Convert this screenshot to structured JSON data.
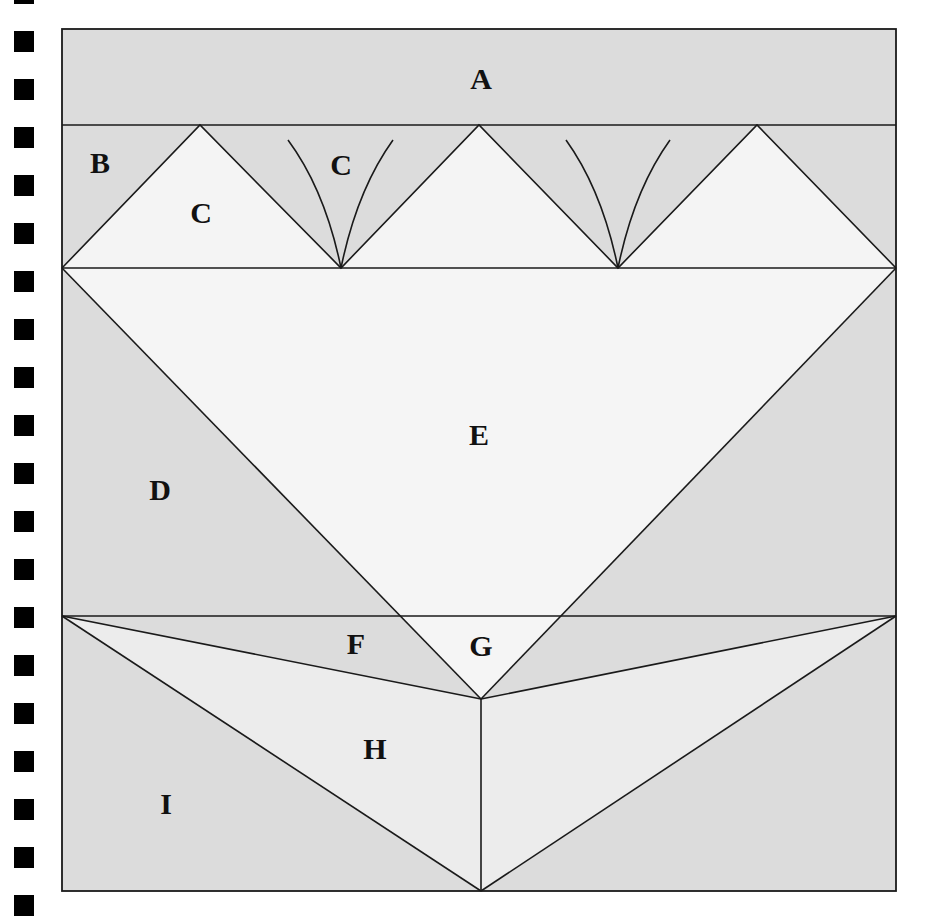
{
  "colors": {
    "gray": "#dcdcdc",
    "light": "#f4f4f4",
    "mid": "#ebebeb",
    "line": "#1a1a1a",
    "hole": "#000000"
  },
  "binder_holes": {
    "count": 20,
    "spacing_px": 48
  },
  "labels": {
    "A": "A",
    "B": "B",
    "C1": "C",
    "C2": "C",
    "D": "D",
    "E": "E",
    "F": "F",
    "G": "G",
    "H": "H",
    "I": "I"
  }
}
